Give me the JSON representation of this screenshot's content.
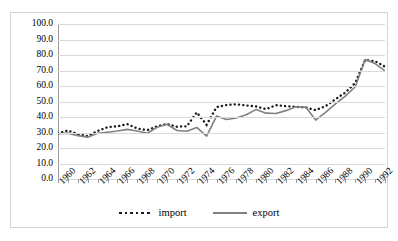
{
  "chart_data": {
    "type": "line",
    "title": "",
    "xlabel": "",
    "ylabel": "",
    "ylim": [
      0.0,
      100.0
    ],
    "ytick_step": 10.0,
    "grid": true,
    "legend_position": "bottom-center",
    "ytick_labels": [
      "100.0",
      "90.0",
      "80.0",
      "70.0",
      "60.0",
      "50.0",
      "40.0",
      "30.0",
      "20.0",
      "10.0",
      "0.0"
    ],
    "ytick_values": [
      100.0,
      90.0,
      80.0,
      70.0,
      60.0,
      50.0,
      40.0,
      30.0,
      20.0,
      10.0,
      0.0
    ],
    "xtick_labels": [
      "1960",
      "1962",
      "1964",
      "1966",
      "1968",
      "1970",
      "1972",
      "1974",
      "1976",
      "1978",
      "1980",
      "1982",
      "1984",
      "1986",
      "1988",
      "1990",
      "1992"
    ],
    "x": [
      1960,
      1961,
      1962,
      1963,
      1964,
      1965,
      1966,
      1967,
      1968,
      1969,
      1970,
      1971,
      1972,
      1973,
      1974,
      1975,
      1976,
      1977,
      1978,
      1979,
      1980,
      1981,
      1982,
      1983,
      1984,
      1985,
      1986,
      1987,
      1988,
      1989,
      1990,
      1991,
      1992,
      1993
    ],
    "series": [
      {
        "name": "import",
        "style": "dotted",
        "color": "#1a1a1a",
        "values": [
          29.5,
          31.3,
          29.0,
          27.6,
          31.0,
          33.4,
          34.0,
          35.4,
          32.6,
          31.5,
          34.0,
          35.5,
          33.7,
          34.0,
          43.0,
          35.0,
          46.4,
          47.7,
          48.2,
          47.4,
          46.8,
          45.1,
          47.6,
          47.0,
          46.5,
          46.2,
          44.4,
          47.0,
          51.5,
          55.8,
          62.0,
          76.8,
          76.0,
          72.5
        ]
      },
      {
        "name": "export",
        "style": "solid",
        "color": "#808080",
        "values": [
          29.2,
          29.6,
          28.0,
          27.0,
          29.5,
          30.2,
          31.0,
          32.0,
          31.0,
          29.5,
          33.4,
          35.3,
          31.3,
          30.8,
          33.3,
          27.6,
          40.6,
          38.4,
          39.4,
          41.5,
          44.9,
          42.5,
          42.3,
          44.1,
          46.6,
          46.4,
          38.0,
          43.0,
          48.5,
          53.5,
          59.5,
          77.1,
          74.5,
          69.7
        ]
      }
    ]
  },
  "legend": {
    "items": [
      {
        "label": "import"
      },
      {
        "label": "export"
      }
    ]
  }
}
